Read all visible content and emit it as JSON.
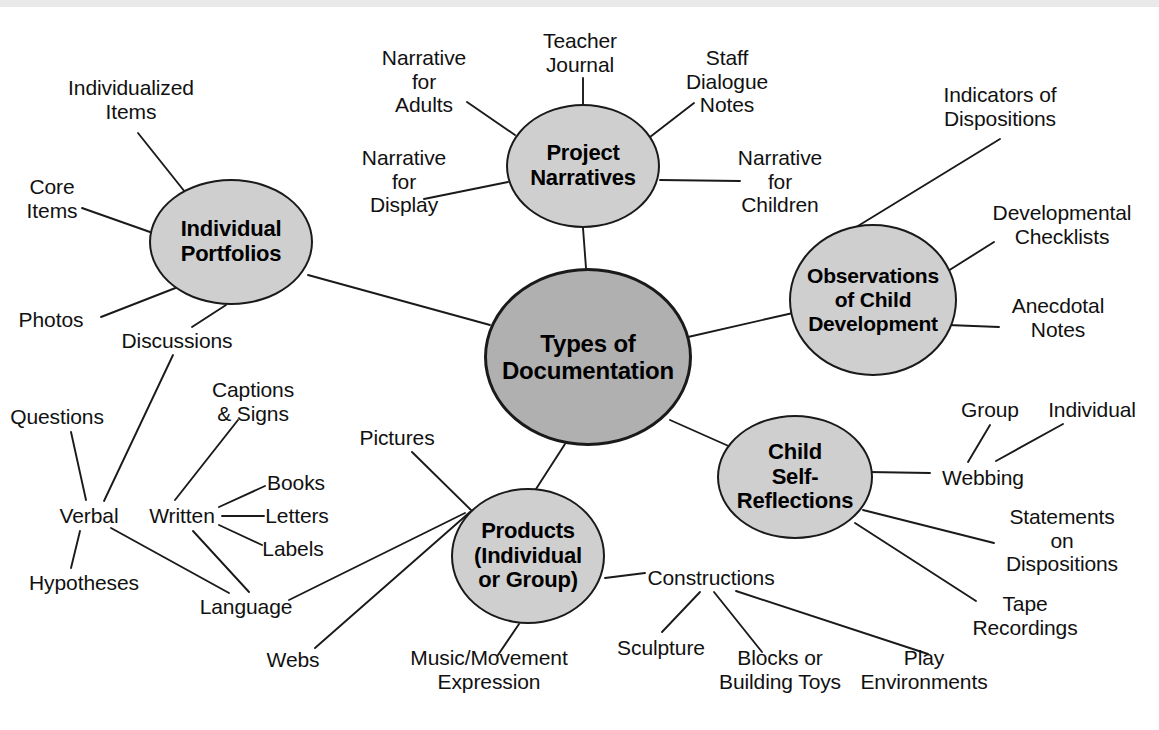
{
  "diagram": {
    "type": "mind-map",
    "title": "Types of Documentation",
    "center": {
      "id": "center",
      "label": "Types of\nDocumentation",
      "cx": 588,
      "cy": 357,
      "rx": 104,
      "ry": 89,
      "fill": "#b0b0b0",
      "font_size": 24
    },
    "branches": [
      {
        "id": "individual-portfolios",
        "label": "Individual\nPortfolios",
        "cx": 231,
        "cy": 242,
        "rx": 82,
        "ry": 63,
        "fill": "#cfcfcf",
        "font_size": 22,
        "children": [
          "individualized-items",
          "core-items",
          "photos",
          "discussions"
        ]
      },
      {
        "id": "project-narratives",
        "label": "Project\nNarratives",
        "cx": 583,
        "cy": 166,
        "rx": 77,
        "ry": 62,
        "fill": "#cfcfcf",
        "font_size": 22,
        "children": [
          "narrative-for-adults",
          "teacher-journal",
          "staff-dialogue-notes",
          "narrative-for-display",
          "narrative-for-children"
        ]
      },
      {
        "id": "observations-of-child-development",
        "label": "Observations\nof Child\nDevelopment",
        "cx": 873,
        "cy": 300,
        "rx": 84,
        "ry": 76,
        "fill": "#cfcfcf",
        "font_size": 21,
        "children": [
          "indicators-of-dispositions",
          "developmental-checklists",
          "anecdotal-notes"
        ]
      },
      {
        "id": "child-self-reflections",
        "label": "Child\nSelf-\nReflections",
        "cx": 795,
        "cy": 477,
        "rx": 78,
        "ry": 62,
        "fill": "#cfcfcf",
        "font_size": 22,
        "children": [
          "webbing",
          "statements-on-dispositions",
          "tape-recordings"
        ]
      },
      {
        "id": "products-individual-or-group",
        "label": "Products\n(Individual\nor Group)",
        "cx": 528,
        "cy": 556,
        "rx": 77,
        "ry": 68,
        "fill": "#cfcfcf",
        "font_size": 22,
        "children": [
          "pictures",
          "language",
          "music-movement-expression",
          "constructions"
        ]
      }
    ],
    "leaves": [
      {
        "id": "individualized-items",
        "label": "Individualized\nItems",
        "x": 131,
        "y": 100,
        "align": "center"
      },
      {
        "id": "core-items",
        "label": "Core\nItems",
        "x": 52,
        "y": 199,
        "align": "center"
      },
      {
        "id": "photos",
        "label": "Photos",
        "x": 51,
        "y": 320,
        "align": "center"
      },
      {
        "id": "discussions",
        "label": "Discussions",
        "x": 177,
        "y": 341,
        "align": "center"
      },
      {
        "id": "questions",
        "label": "Questions",
        "x": 57,
        "y": 417,
        "align": "center"
      },
      {
        "id": "verbal",
        "label": "Verbal",
        "x": 89,
        "y": 516,
        "align": "center"
      },
      {
        "id": "hypotheses",
        "label": "Hypotheses",
        "x": 84,
        "y": 583,
        "align": "center"
      },
      {
        "id": "captions-signs",
        "label": "Captions\n& Signs",
        "x": 253,
        "y": 402,
        "align": "center"
      },
      {
        "id": "written",
        "label": "Written",
        "x": 182,
        "y": 516,
        "align": "center"
      },
      {
        "id": "books",
        "label": "Books",
        "x": 296,
        "y": 483,
        "align": "center"
      },
      {
        "id": "letters",
        "label": "Letters",
        "x": 297,
        "y": 516,
        "align": "center"
      },
      {
        "id": "labels",
        "label": "Labels",
        "x": 293,
        "y": 549,
        "align": "center"
      },
      {
        "id": "language",
        "label": "Language",
        "x": 246,
        "y": 607,
        "align": "center"
      },
      {
        "id": "webs",
        "label": "Webs",
        "x": 293,
        "y": 660,
        "align": "center"
      },
      {
        "id": "music-movement-expression",
        "label": "Music/Movement\nExpression",
        "x": 489,
        "y": 670,
        "align": "center"
      },
      {
        "id": "pictures",
        "label": "Pictures",
        "x": 397,
        "y": 438,
        "align": "center"
      },
      {
        "id": "narrative-for-adults",
        "label": "Narrative\nfor\nAdults",
        "x": 424,
        "y": 81,
        "align": "center"
      },
      {
        "id": "teacher-journal",
        "label": "Teacher\nJournal",
        "x": 580,
        "y": 53,
        "align": "center"
      },
      {
        "id": "staff-dialogue-notes",
        "label": "Staff\nDialogue\nNotes",
        "x": 727,
        "y": 81,
        "align": "center"
      },
      {
        "id": "narrative-for-display",
        "label": "Narrative\nfor\nDisplay",
        "x": 404,
        "y": 181,
        "align": "center"
      },
      {
        "id": "narrative-for-children",
        "label": "Narrative\nfor\nChildren",
        "x": 780,
        "y": 181,
        "align": "center"
      },
      {
        "id": "indicators-of-dispositions",
        "label": "Indicators of\nDispositions",
        "x": 1000,
        "y": 107,
        "align": "center"
      },
      {
        "id": "developmental-checklists",
        "label": "Developmental\nChecklists",
        "x": 1062,
        "y": 225,
        "align": "center"
      },
      {
        "id": "anecdotal-notes",
        "label": "Anecdotal\nNotes",
        "x": 1058,
        "y": 318,
        "align": "center"
      },
      {
        "id": "group",
        "label": "Group",
        "x": 990,
        "y": 410,
        "align": "center"
      },
      {
        "id": "individual",
        "label": "Individual",
        "x": 1092,
        "y": 410,
        "align": "center"
      },
      {
        "id": "webbing",
        "label": "Webbing",
        "x": 983,
        "y": 478,
        "align": "center"
      },
      {
        "id": "statements-on-dispositions",
        "label": "Statements on\nDispositions",
        "x": 1062,
        "y": 540,
        "align": "center"
      },
      {
        "id": "tape-recordings",
        "label": "Tape\nRecordings",
        "x": 1025,
        "y": 616,
        "align": "center"
      },
      {
        "id": "constructions",
        "label": "Constructions",
        "x": 711,
        "y": 578,
        "align": "center"
      },
      {
        "id": "sculpture",
        "label": "Sculpture",
        "x": 661,
        "y": 648,
        "align": "center"
      },
      {
        "id": "blocks-or-building-toys",
        "label": "Blocks or\nBuilding Toys",
        "x": 780,
        "y": 670,
        "align": "center"
      },
      {
        "id": "play-environments",
        "label": "Play\nEnvironments",
        "x": 924,
        "y": 670,
        "align": "center"
      }
    ],
    "edges": [
      {
        "from": "center",
        "to": "individual-portfolios",
        "x1": 490,
        "y1": 325,
        "x2": 308,
        "y2": 275
      },
      {
        "from": "center",
        "to": "project-narratives",
        "x1": 586,
        "y1": 268,
        "x2": 583,
        "y2": 228
      },
      {
        "from": "center",
        "to": "observations-of-child-development",
        "x1": 688,
        "y1": 337,
        "x2": 793,
        "y2": 313
      },
      {
        "from": "center",
        "to": "child-self-reflections",
        "x1": 670,
        "y1": 420,
        "x2": 742,
        "y2": 452
      },
      {
        "from": "center",
        "to": "products-individual-or-group",
        "x1": 565,
        "y1": 444,
        "x2": 536,
        "y2": 489
      },
      {
        "from": "individual-portfolios",
        "to": "individualized-items",
        "x1": 185,
        "y1": 192,
        "x2": 138,
        "y2": 133
      },
      {
        "from": "individual-portfolios",
        "to": "core-items",
        "x1": 150,
        "y1": 232,
        "x2": 82,
        "y2": 208
      },
      {
        "from": "individual-portfolios",
        "to": "photos",
        "x1": 178,
        "y1": 287,
        "x2": 101,
        "y2": 317
      },
      {
        "from": "individual-portfolios",
        "to": "discussions",
        "x1": 226,
        "y1": 305,
        "x2": 192,
        "y2": 327
      },
      {
        "from": "discussions",
        "to": "verbal",
        "x1": 173,
        "y1": 355,
        "x2": 104,
        "y2": 501
      },
      {
        "from": "questions",
        "to": "verbal",
        "x1": 71,
        "y1": 432,
        "x2": 86,
        "y2": 500
      },
      {
        "from": "verbal",
        "to": "hypotheses",
        "x1": 80,
        "y1": 531,
        "x2": 71,
        "y2": 568
      },
      {
        "from": "verbal",
        "to": "language",
        "x1": 111,
        "y1": 528,
        "x2": 229,
        "y2": 593
      },
      {
        "from": "captions-signs",
        "to": "written",
        "x1": 238,
        "y1": 420,
        "x2": 175,
        "y2": 500
      },
      {
        "from": "written",
        "to": "books",
        "x1": 219,
        "y1": 507,
        "x2": 265,
        "y2": 486
      },
      {
        "from": "written",
        "to": "letters",
        "x1": 222,
        "y1": 516,
        "x2": 264,
        "y2": 516
      },
      {
        "from": "written",
        "to": "labels",
        "x1": 219,
        "y1": 525,
        "x2": 262,
        "y2": 545
      },
      {
        "from": "written",
        "to": "language",
        "x1": 193,
        "y1": 531,
        "x2": 249,
        "y2": 592
      },
      {
        "from": "language",
        "to": "products-individual-or-group",
        "x1": 289,
        "y1": 600,
        "x2": 465,
        "y2": 513
      },
      {
        "from": "webs",
        "to": "products-individual-or-group",
        "x1": 315,
        "y1": 648,
        "x2": 470,
        "y2": 512
      },
      {
        "from": "products-individual-or-group",
        "to": "pictures",
        "x1": 473,
        "y1": 512,
        "x2": 412,
        "y2": 452
      },
      {
        "from": "products-individual-or-group",
        "to": "music-movement-expression",
        "x1": 519,
        "y1": 624,
        "x2": 498,
        "y2": 655
      },
      {
        "from": "products-individual-or-group",
        "to": "constructions",
        "x1": 605,
        "y1": 578,
        "x2": 645,
        "y2": 573
      },
      {
        "from": "constructions",
        "to": "sculpture",
        "x1": 700,
        "y1": 592,
        "x2": 662,
        "y2": 632
      },
      {
        "from": "constructions",
        "to": "blocks-or-building-toys",
        "x1": 714,
        "y1": 592,
        "x2": 762,
        "y2": 652
      },
      {
        "from": "constructions",
        "to": "play-environments",
        "x1": 736,
        "y1": 591,
        "x2": 928,
        "y2": 654
      },
      {
        "from": "project-narratives",
        "to": "narrative-for-adults",
        "x1": 515,
        "y1": 135,
        "x2": 467,
        "y2": 102
      },
      {
        "from": "project-narratives",
        "to": "teacher-journal",
        "x1": 583,
        "y1": 104,
        "x2": 583,
        "y2": 78
      },
      {
        "from": "project-narratives",
        "to": "staff-dialogue-notes",
        "x1": 650,
        "y1": 137,
        "x2": 694,
        "y2": 103
      },
      {
        "from": "project-narratives",
        "to": "narrative-for-display",
        "x1": 508,
        "y1": 182,
        "x2": 424,
        "y2": 199
      },
      {
        "from": "project-narratives",
        "to": "narrative-for-children",
        "x1": 660,
        "y1": 180,
        "x2": 740,
        "y2": 181
      },
      {
        "from": "observations-of-child-development",
        "to": "indicators-of-dispositions",
        "x1": 853,
        "y1": 229,
        "x2": 1000,
        "y2": 139
      },
      {
        "from": "observations-of-child-development",
        "to": "developmental-checklists",
        "x1": 940,
        "y1": 276,
        "x2": 994,
        "y2": 242
      },
      {
        "from": "observations-of-child-development",
        "to": "anecdotal-notes",
        "x1": 948,
        "y1": 325,
        "x2": 999,
        "y2": 327
      },
      {
        "from": "child-self-reflections",
        "to": "webbing",
        "x1": 868,
        "y1": 472,
        "x2": 930,
        "y2": 473
      },
      {
        "from": "webbing",
        "to": "group",
        "x1": 968,
        "y1": 462,
        "x2": 990,
        "y2": 425
      },
      {
        "from": "webbing",
        "to": "individual",
        "x1": 996,
        "y1": 461,
        "x2": 1063,
        "y2": 424
      },
      {
        "from": "child-self-reflections",
        "to": "statements-on-dispositions",
        "x1": 863,
        "y1": 510,
        "x2": 994,
        "y2": 543
      },
      {
        "from": "child-self-reflections",
        "to": "tape-recordings",
        "x1": 855,
        "y1": 523,
        "x2": 976,
        "y2": 601
      }
    ]
  }
}
